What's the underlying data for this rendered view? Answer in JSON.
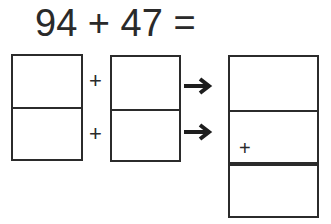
{
  "equation": {
    "text": "94 + 47 =",
    "addend1": 94,
    "addend2": 47
  },
  "left_box": {
    "cells": [
      "",
      ""
    ]
  },
  "middle_box": {
    "cells": [
      "",
      ""
    ]
  },
  "operators": {
    "row1": "+",
    "row2": "+"
  },
  "arrows": [
    "arrow-right",
    "arrow-right"
  ],
  "result_box": {
    "cells": [
      "",
      "",
      ""
    ],
    "carry_sign": "+"
  }
}
